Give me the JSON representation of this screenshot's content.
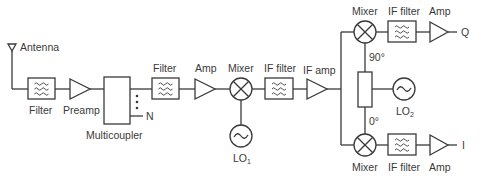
{
  "diagram": {
    "colors": {
      "stroke": "#3a3a3a",
      "background": "#ffffff",
      "text": "#3a3a3a"
    },
    "blocks": [
      {
        "id": "antenna",
        "type": "antenna",
        "label": "Antenna"
      },
      {
        "id": "filter1",
        "type": "filter",
        "label": "Filter"
      },
      {
        "id": "preamp",
        "type": "amplifier",
        "label": "Preamp"
      },
      {
        "id": "multicoupler",
        "type": "multicoupler",
        "label": "Multicoupler",
        "outputs_label": "N"
      },
      {
        "id": "filter2",
        "type": "filter",
        "label": "Filter"
      },
      {
        "id": "amp1",
        "type": "amplifier",
        "label": "Amp"
      },
      {
        "id": "mixer1",
        "type": "mixer",
        "label": "Mixer"
      },
      {
        "id": "lo1",
        "type": "oscillator",
        "label": "LO",
        "subscript": "1"
      },
      {
        "id": "iffilter1",
        "type": "filter",
        "label": "IF filter"
      },
      {
        "id": "ifamp",
        "type": "amplifier",
        "label": "IF amp"
      },
      {
        "id": "mixer_q",
        "type": "mixer",
        "label": "Mixer"
      },
      {
        "id": "iffilter_q",
        "type": "filter",
        "label": "IF filter"
      },
      {
        "id": "amp_q",
        "type": "amplifier",
        "label": "Amp"
      },
      {
        "id": "out_q",
        "type": "output",
        "label": "Q"
      },
      {
        "id": "splitter",
        "type": "phase-splitter",
        "label_top": "90°",
        "label_bottom": "0°"
      },
      {
        "id": "lo2",
        "type": "oscillator",
        "label": "LO",
        "subscript": "2"
      },
      {
        "id": "mixer_i",
        "type": "mixer",
        "label": "Mixer"
      },
      {
        "id": "iffilter_i",
        "type": "filter",
        "label": "IF filter"
      },
      {
        "id": "amp_i",
        "type": "amplifier",
        "label": "Amp"
      },
      {
        "id": "out_i",
        "type": "output",
        "label": "I"
      }
    ],
    "connections": [
      [
        "antenna",
        "filter1"
      ],
      [
        "filter1",
        "preamp"
      ],
      [
        "preamp",
        "multicoupler"
      ],
      [
        "multicoupler",
        "filter2"
      ],
      [
        "filter2",
        "amp1"
      ],
      [
        "amp1",
        "mixer1"
      ],
      [
        "lo1",
        "mixer1"
      ],
      [
        "mixer1",
        "iffilter1"
      ],
      [
        "iffilter1",
        "ifamp"
      ],
      [
        "ifamp",
        "mixer_q"
      ],
      [
        "ifamp",
        "mixer_i"
      ],
      [
        "lo2",
        "splitter"
      ],
      [
        "splitter",
        "mixer_q"
      ],
      [
        "splitter",
        "mixer_i"
      ],
      [
        "mixer_q",
        "iffilter_q"
      ],
      [
        "iffilter_q",
        "amp_q"
      ],
      [
        "amp_q",
        "out_q"
      ],
      [
        "mixer_i",
        "iffilter_i"
      ],
      [
        "iffilter_i",
        "amp_i"
      ],
      [
        "amp_i",
        "out_i"
      ]
    ]
  },
  "labels": {
    "antenna": "Antenna",
    "filter1": "Filter",
    "preamp": "Preamp",
    "multicoupler": "Multicoupler",
    "n": "N",
    "filter2": "Filter",
    "amp1": "Amp",
    "mixer1": "Mixer",
    "lo1": "LO",
    "lo1_sub": "1",
    "iffilter1": "IF filter",
    "ifamp": "IF amp",
    "mixer_q": "Mixer",
    "iffilter_q": "IF filter",
    "amp_q": "Amp",
    "q": "Q",
    "phase90": "90°",
    "phase0": "0°",
    "lo2": "LO",
    "lo2_sub": "2",
    "mixer_i": "Mixer",
    "iffilter_i": "IF filter",
    "amp_i": "Amp",
    "i": "I"
  }
}
